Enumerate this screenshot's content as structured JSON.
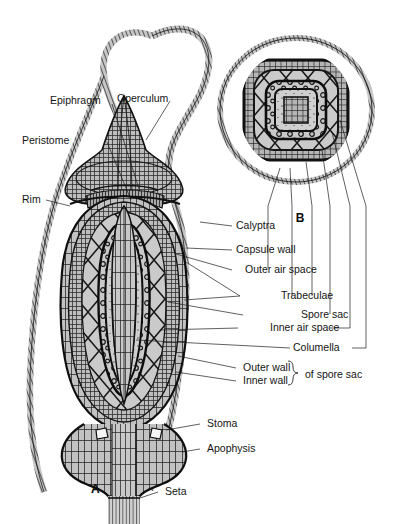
{
  "figure": {
    "background_color": "#ffffff",
    "ink_color": "#141414",
    "tissue_fill": "#b8b8b8",
    "tissue_fill_light": "#cccccc",
    "panels": [
      {
        "id": "A",
        "label": "A",
        "caption": "longitudinal section of capsule"
      },
      {
        "id": "B",
        "label": "B",
        "caption": "transverse section of capsule"
      }
    ],
    "labels": {
      "epiphragm": "Epiphragm",
      "operculum": "Operculum",
      "peristome": "Peristome",
      "rim": "Rim",
      "calyptra": "Calyptra",
      "capsule_wall": "Capsule wall",
      "outer_air_space": "Outer air space",
      "trabeculae": "Trabeculae",
      "spore_sac": "Spore sac",
      "inner_air_space": "Inner air space",
      "columella": "Columella",
      "outer_wall": "Outer wall",
      "inner_wall": "Inner wall",
      "of_spore_sac": "of spore sac",
      "stoma": "Stoma",
      "apophysis": "Apophysis",
      "seta": "Seta",
      "panel_a": "A",
      "panel_b": "B"
    }
  }
}
